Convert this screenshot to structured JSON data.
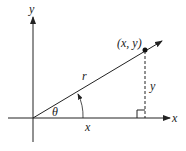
{
  "diagram": {
    "type": "polar-coordinates",
    "labels": {
      "y_axis": "y",
      "x_axis": "x",
      "point": "(x, y)",
      "radius": "r",
      "angle": "θ",
      "adjacent": "x",
      "opposite": "y"
    },
    "colors": {
      "ink": "#222222"
    }
  }
}
